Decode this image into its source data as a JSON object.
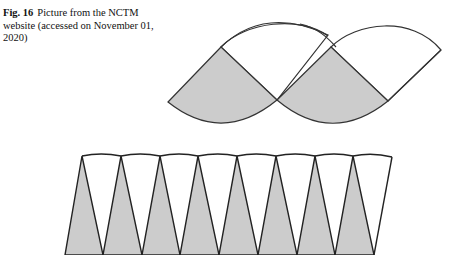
{
  "caption": {
    "label": "Fig. 16",
    "text": "Picture from the NCTM website (accessed on November 01, 2020)"
  },
  "figure": {
    "fill_color": "#cccccc",
    "stroke_color": "#333333",
    "top_figure": {
      "description": "Two overlapping circle-sector cone nets, lower halves shaded gray"
    },
    "bottom_figure": {
      "description": "Row of alternating triangles forming a rectangle-like strip, upward triangles shaded gray",
      "shaded_triangles": 8,
      "white_triangles": 8
    }
  }
}
